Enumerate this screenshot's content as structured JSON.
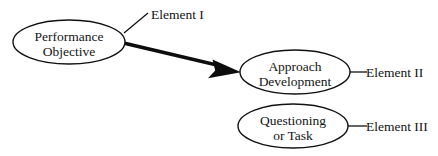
{
  "diagram": {
    "background_color": "#ffffff",
    "stroke_color": "#111111",
    "text_color": "#141414",
    "nodes": [
      {
        "id": "performance-objective",
        "shape": "ellipse",
        "line1": "Performance",
        "line2": "Objective",
        "cx": 69,
        "cy": 42,
        "rx": 56,
        "ry": 22
      },
      {
        "id": "approach-development",
        "shape": "ellipse",
        "line1": "Approach",
        "line2": "Development",
        "cx": 295,
        "cy": 72,
        "rx": 55,
        "ry": 22
      },
      {
        "id": "questioning-or-task",
        "shape": "ellipse",
        "line1": "Questioning",
        "line2": "or Task",
        "cx": 293,
        "cy": 126,
        "rx": 55,
        "ry": 22
      }
    ],
    "labels": [
      {
        "id": "element-1",
        "text": "Element I",
        "x": 151,
        "y": 19,
        "leader": {
          "x1": 124,
          "y1": 33,
          "x2": 148,
          "y2": 13
        }
      },
      {
        "id": "element-2",
        "text": "Element II",
        "x": 366,
        "y": 77,
        "leader": {
          "x1": 350,
          "y1": 72,
          "x2": 366,
          "y2": 72
        }
      },
      {
        "id": "element-3",
        "text": "Element III",
        "x": 366,
        "y": 131,
        "leader": {
          "x1": 348,
          "y1": 126,
          "x2": 366,
          "y2": 126
        }
      }
    ],
    "connectors": [
      {
        "id": "objective-to-approach",
        "type": "tapered-arrow",
        "from": "performance-objective",
        "to": "approach-development",
        "start": {
          "x": 124,
          "y": 43
        },
        "end": {
          "x": 241,
          "y": 72
        }
      }
    ]
  }
}
